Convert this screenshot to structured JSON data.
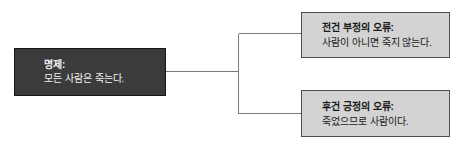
{
  "diagram": {
    "proposition_box": {
      "title": "명제:",
      "body": "모든 사람은 죽는다."
    },
    "fallacy_boxes": [
      {
        "title": "전건 부정의 오류:",
        "body": "사람이 아니면 죽지 않는다."
      },
      {
        "title": "후건 긍정의 오류:",
        "body": "죽었으므로 사람이다."
      }
    ],
    "colors": {
      "background": "#ffffff",
      "proposition-fill": "#3b3b3b",
      "proposition-border": "#161616",
      "proposition-text": "#f2f2f2",
      "fallacy-fill": "#d3d3d3",
      "fallacy-border": "#4e4e4e",
      "fallacy-text": "#1a1a1a",
      "connector": "#7a7a7a"
    }
  }
}
